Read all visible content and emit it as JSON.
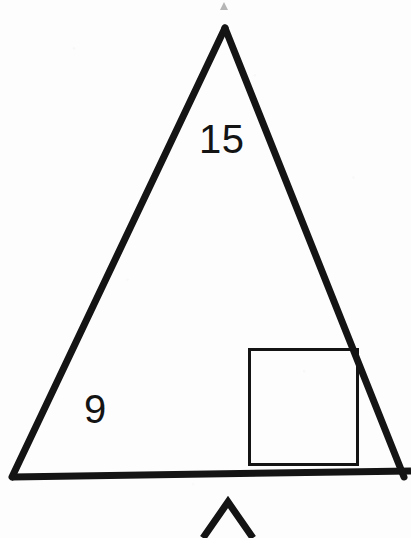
{
  "figure": {
    "type": "geometry-diagram",
    "background_color": "#fdfdfd",
    "stroke_color": "#141414",
    "labels": [
      {
        "name": "slant-side-length",
        "text": "15"
      },
      {
        "name": "base-side-length",
        "text": "9"
      }
    ],
    "label_15": "15",
    "label_9": "9",
    "shapes": {
      "main_triangle": {
        "name": "main-triangle",
        "apex": {
          "x": 225,
          "y": 28
        },
        "bottom_left": {
          "x": 12,
          "y": 477
        },
        "bottom_right": {
          "x": 404,
          "y": 477
        },
        "stroke_width": 7
      },
      "inner_square": {
        "name": "inner-square",
        "x": 248,
        "y": 348,
        "width": 110,
        "height": 117,
        "stroke_width": 3
      },
      "base_line": {
        "name": "triangle-base-line",
        "from": {
          "x": 12,
          "y": 477
        },
        "to": {
          "x": 411,
          "y": 471
        },
        "stroke_width": 7
      },
      "partial_triangle": {
        "name": "partial-triangle-below",
        "apex": {
          "x": 228,
          "y": 502
        },
        "left_end": {
          "x": 202,
          "y": 538
        },
        "right_end": {
          "x": 254,
          "y": 538
        },
        "stroke_width": 7
      }
    }
  }
}
